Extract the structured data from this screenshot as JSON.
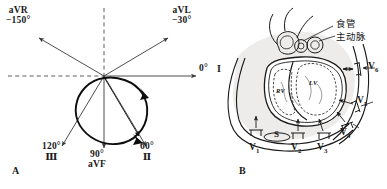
{
  "figure": {
    "panel_a_label": "A",
    "panel_b_label": "B"
  },
  "panel_a": {
    "title": "Hexaxial reference system with QRS vector loop",
    "axes": [
      {
        "lead": "aVR",
        "angle": "−150°",
        "roman": "",
        "deg": -150
      },
      {
        "lead": "aVL",
        "angle": "−30°",
        "roman": "",
        "deg": -30
      },
      {
        "lead": "",
        "angle": "0°",
        "roman": "I",
        "deg": 0
      },
      {
        "lead": "",
        "angle": "60°",
        "roman": "Ⅱ",
        "deg": 60
      },
      {
        "lead": "aVF",
        "angle": "90°",
        "roman": "",
        "deg": 90
      },
      {
        "lead": "",
        "angle": "120°",
        "roman": "Ⅲ",
        "deg": 120
      }
    ],
    "labels": {
      "avr_lead": "aVR",
      "avr_angle": "−150°",
      "avl_lead": "aVL",
      "avl_angle": "−30°",
      "lead_i_angle": "0°",
      "lead_i_roman": "I",
      "lead_ii_angle": "60°",
      "lead_ii_roman": "Ⅱ",
      "avf_angle": "90°",
      "avf_lead": "aVF",
      "lead_iii_angle": "120°",
      "lead_iii_roman": "Ⅲ"
    }
  },
  "panel_b": {
    "title": "Transverse chest section with precordial lead positions",
    "annotations": {
      "esophagus": "食管",
      "aorta": "主动脉"
    },
    "chambers": {
      "right_ventricle": "RV",
      "left_ventricle": "LV"
    },
    "sternum": "S",
    "precordial_leads": [
      {
        "id": "V1",
        "label": "V",
        "sub": "1"
      },
      {
        "id": "V2",
        "label": "V",
        "sub": "2"
      },
      {
        "id": "V3",
        "label": "V",
        "sub": "3"
      },
      {
        "id": "V4",
        "label": "V",
        "sub": "4"
      },
      {
        "id": "V5",
        "label": "V",
        "sub": "5"
      },
      {
        "id": "V6",
        "label": "V",
        "sub": "6"
      }
    ]
  },
  "colors": {
    "ink": "#1a1a1a",
    "line": "#3a3a3a",
    "dashed": "#4a4a4a",
    "loop": "#0d0d0d",
    "body_fill": "#ebe9e6",
    "background": "#ffffff"
  }
}
